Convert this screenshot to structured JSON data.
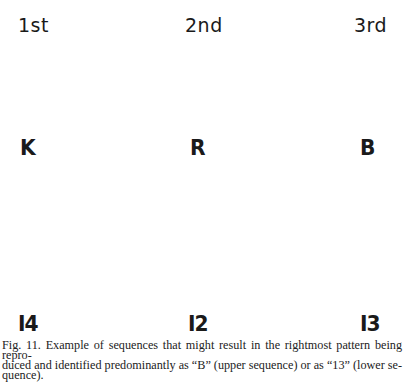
{
  "figure": {
    "column_headers": [
      "1st",
      "2nd",
      "3rd"
    ],
    "upper_sequence": [
      "K",
      "R",
      "B"
    ],
    "lower_sequence": [
      "I4",
      "I2",
      "I3"
    ],
    "caption_lines": [
      "Fig. 11.  Example of sequences that might result in the rightmost pattern being repro-",
      "duced and identified predominantly as “B” (upper sequence) or as “13” (lower se-",
      "quence)."
    ]
  }
}
